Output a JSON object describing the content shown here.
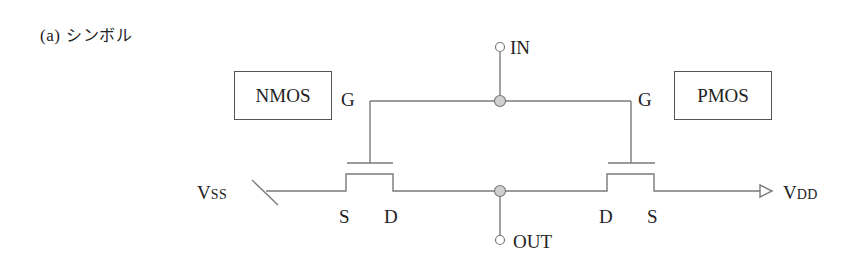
{
  "caption": {
    "prefix": "(a)",
    "title": "シンボル"
  },
  "boxes": {
    "nmos": "NMOS",
    "pmos": "PMOS"
  },
  "terminals": {
    "in": "IN",
    "out": "OUT",
    "vss_main": "V",
    "vss_sub": "SS",
    "vdd_main": "V",
    "vdd_sub": "DD"
  },
  "nmos_pins": {
    "gate": "G",
    "source": "S",
    "drain": "D"
  },
  "pmos_pins": {
    "gate": "G",
    "drain": "D",
    "source": "S"
  },
  "colors": {
    "wire": "#7a7a7a",
    "text": "#222222",
    "junction_fill": "#d0d0d0",
    "box_border": "#555555"
  }
}
